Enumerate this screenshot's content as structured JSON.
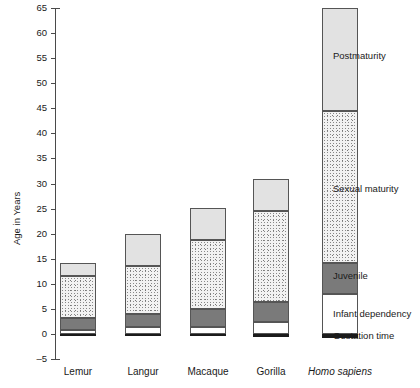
{
  "chart_data": {
    "type": "bar",
    "subtype": "stacked-bar",
    "title": "",
    "xlabel": "",
    "ylabel": "Age in Years",
    "ylim": [
      -5,
      65
    ],
    "ytick_step": 5,
    "yticks": [
      -5,
      0,
      5,
      10,
      15,
      20,
      25,
      30,
      35,
      40,
      45,
      50,
      55,
      60,
      65
    ],
    "ytick_labels": [
      "–5",
      "0",
      "5",
      "10",
      "15",
      "20",
      "25",
      "30",
      "35",
      "40",
      "45",
      "50",
      "55",
      "60",
      "65"
    ],
    "grid": false,
    "legend_position": "right-inline",
    "categories": [
      "Lemur",
      "Langur",
      "Macaque",
      "Gorilla",
      "Homo sapiens"
    ],
    "category_styles": [
      "normal",
      "normal",
      "normal",
      "normal",
      "italic"
    ],
    "series": [
      {
        "name": "Gestation time",
        "color": "#1b1b1b",
        "values": [
          -0.35,
          -0.45,
          -0.5,
          -0.7,
          -0.75
        ]
      },
      {
        "name": "Infant dependency",
        "color": "#ffffff",
        "values": [
          0.7,
          1.3,
          1.3,
          2.3,
          8.0
        ]
      },
      {
        "name": "Juvenile",
        "color": "#7a7a7a",
        "values": [
          2.5,
          2.7,
          3.7,
          4.0,
          6.2
        ]
      },
      {
        "name": "Sexual maturity",
        "color": "#f2f2f2",
        "values": [
          8.3,
          9.5,
          13.8,
          18.2,
          30.3
        ]
      },
      {
        "name": "Postmaturity",
        "color": "#e2e2e2",
        "values": [
          2.7,
          6.5,
          6.4,
          6.3,
          20.5
        ]
      }
    ],
    "stack_boundaries": {
      "Lemur": {
        "gestation_start": -0.35,
        "zero": 0,
        "infant_top": 0.7,
        "juvenile_top": 3.2,
        "sexual_top": 11.5,
        "total": 14.2
      },
      "Langur": {
        "gestation_start": -0.45,
        "zero": 0,
        "infant_top": 1.3,
        "juvenile_top": 4.0,
        "sexual_top": 13.5,
        "total": 20.0
      },
      "Macaque": {
        "gestation_start": -0.5,
        "zero": 0,
        "infant_top": 1.3,
        "juvenile_top": 5.0,
        "sexual_top": 18.8,
        "total": 25.2
      },
      "Gorilla": {
        "gestation_start": -0.7,
        "zero": 0,
        "infant_top": 2.3,
        "juvenile_top": 6.3,
        "sexual_top": 24.5,
        "total": 30.8
      },
      "Homo sapiens": {
        "gestation_start": -0.75,
        "zero": 0,
        "infant_top": 8.0,
        "juvenile_top": 14.2,
        "sexual_top": 44.5,
        "total": 65.0
      }
    },
    "legend_entries": [
      {
        "label": "Postmaturity",
        "color": "#e2e2e2",
        "y_value": 55.5
      },
      {
        "label": "Sexual maturity",
        "color": "#f2f2f2",
        "y_value": 29.0
      },
      {
        "label": "Juvenile",
        "color": "#7a7a7a",
        "y_value": 11.5
      },
      {
        "label": "Infant dependency",
        "color": "#ffffff",
        "y_value": 4.0
      },
      {
        "label": "Gestation time",
        "color": "#1b1b1b",
        "y_value": -0.4
      }
    ]
  }
}
